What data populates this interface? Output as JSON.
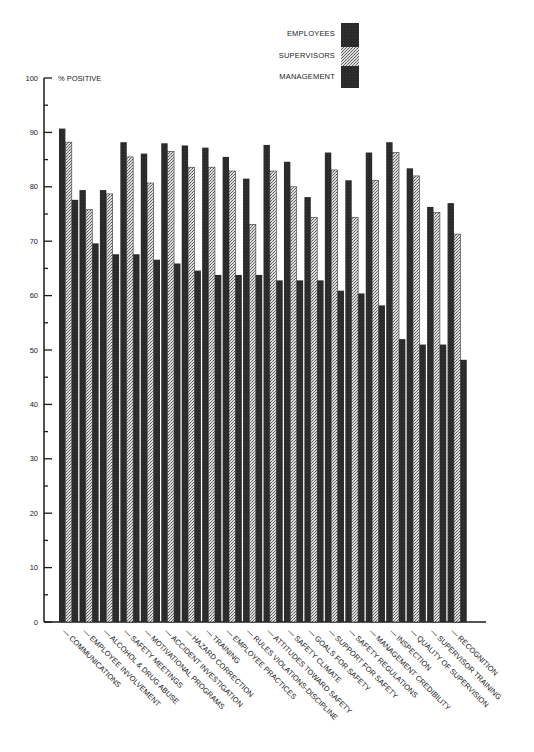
{
  "chart_data": {
    "type": "bar",
    "title": "",
    "ylabel": "% POSITIVE",
    "xlabel": "",
    "ylim": [
      0,
      100
    ],
    "yticks": [
      0,
      10,
      20,
      30,
      40,
      50,
      60,
      70,
      80,
      90,
      100
    ],
    "grid": false,
    "legend_position": "top-right",
    "categories": [
      "COMMUNICATIONS",
      "EMPLOYEE INVOLVEMENT",
      "ALCOHOL & DRUG ABUSE",
      "SAFETY MEETINGS",
      "MOTIVATIONAL PROGRAMS",
      "ACCIDENT INVESTIGATION",
      "HAZARD CORRECTION",
      "TRAINING",
      "EMPLOYEE PRACTICES",
      "RULES VIOLATIONS-DISCIPLINE",
      "ATTITUDES TOWARD SAFETY",
      "SAFETY CLIMATE",
      "GOALS FOR SAFETY",
      "SUPPORT FOR SAFETY",
      "SAFETY REGULATIONS",
      "MANAGEMENT CREDIBILITY",
      "INSPECTION",
      "QUALITY OF SUPERVISION",
      "SUPERVISOR TRAINING",
      "RECOGNITION"
    ],
    "series": [
      {
        "name": "EMPLOYEES",
        "pattern": "dark",
        "values": [
          90.7,
          79.4,
          79.4,
          88.2,
          86.1,
          88.0,
          87.6,
          87.2,
          85.5,
          81.5,
          87.7,
          84.6,
          78.1,
          86.3,
          81.2,
          86.3,
          88.2,
          83.4,
          76.3,
          77.0
        ]
      },
      {
        "name": "SUPERVISORS",
        "pattern": "stippled",
        "values": [
          88.2,
          75.8,
          78.7,
          85.5,
          80.7,
          86.5,
          83.6,
          83.6,
          82.9,
          73.1,
          82.9,
          80.0,
          74.4,
          83.1,
          74.4,
          81.2,
          86.3,
          82.0,
          75.3,
          71.3
        ]
      },
      {
        "name": "MANAGEMENT",
        "pattern": "dark",
        "values": [
          77.6,
          69.6,
          67.6,
          67.6,
          66.6,
          65.9,
          64.6,
          63.8,
          63.8,
          63.8,
          62.8,
          62.8,
          62.8,
          60.9,
          60.4,
          58.2,
          52.0,
          51.0,
          51.0,
          48.2
        ]
      }
    ]
  },
  "legend": {
    "items": [
      {
        "label": "EMPLOYEES"
      },
      {
        "label": "SUPERVISORS"
      },
      {
        "label": "MANAGEMENT"
      }
    ]
  },
  "axis": {
    "y_title": "% POSITIVE"
  },
  "colors": {
    "dark_bar": "#2a2a2a",
    "stipple_bg": "#d8d8d8",
    "stipple_dot": "#555555",
    "axis": "#1a1a1a"
  }
}
